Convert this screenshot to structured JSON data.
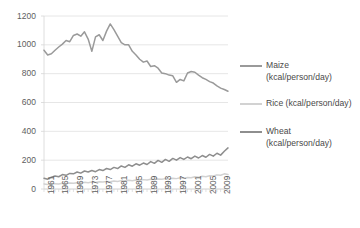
{
  "chart_data": {
    "type": "line",
    "title": "",
    "subtitle": "",
    "xlabel": "",
    "ylabel": "",
    "ylim": [
      0,
      1200
    ],
    "ytick_step": 200,
    "yticks": [
      "0",
      "200",
      "400",
      "600",
      "800",
      "1000",
      "1200"
    ],
    "xlim": [
      1961,
      2011
    ],
    "xticks": [
      "1961",
      "1965",
      "1969",
      "1973",
      "1977",
      "1981",
      "1985",
      "1989",
      "1993",
      "1997",
      "2001",
      "2005",
      "2009"
    ],
    "xtick_step": 4,
    "grid": "horizontal",
    "legend_position": "right",
    "x": [
      1961,
      1962,
      1963,
      1964,
      1965,
      1966,
      1967,
      1968,
      1969,
      1970,
      1971,
      1972,
      1973,
      1974,
      1975,
      1976,
      1977,
      1978,
      1979,
      1980,
      1981,
      1982,
      1983,
      1984,
      1985,
      1986,
      1987,
      1988,
      1989,
      1990,
      1991,
      1992,
      1993,
      1994,
      1995,
      1996,
      1997,
      1998,
      1999,
      2000,
      2001,
      2002,
      2003,
      2004,
      2005,
      2006,
      2007,
      2008,
      2009,
      2010,
      2011
    ],
    "series": [
      {
        "name": "Maize (kcal/person/day)",
        "color": "#9a9a9a",
        "values": [
          963,
          930,
          938,
          962,
          985,
          1005,
          1030,
          1022,
          1065,
          1075,
          1060,
          1090,
          1040,
          955,
          1055,
          1070,
          1030,
          1095,
          1145,
          1105,
          1060,
          1015,
          1000,
          1000,
          955,
          930,
          900,
          880,
          888,
          850,
          855,
          838,
          805,
          800,
          790,
          785,
          740,
          760,
          750,
          805,
          815,
          810,
          790,
          772,
          760,
          745,
          735,
          715,
          700,
          690,
          678
        ]
      },
      {
        "name": "Rice (kcal/person/day)",
        "color": "#d2d2d2",
        "values": [
          35,
          32,
          38,
          36,
          34,
          40,
          38,
          42,
          40,
          44,
          42,
          46,
          44,
          48,
          46,
          50,
          48,
          52,
          50,
          55,
          52,
          58,
          55,
          60,
          58,
          62,
          60,
          65,
          62,
          68,
          65,
          70,
          68,
          72,
          70,
          75,
          72,
          78,
          75,
          80,
          78,
          85,
          82,
          88,
          85,
          92,
          90,
          98,
          95,
          105,
          100
        ]
      },
      {
        "name": "Wheat (kcal/person/day)",
        "color": "#8e8e8e",
        "values": [
          75,
          68,
          82,
          90,
          85,
          100,
          95,
          108,
          105,
          118,
          110,
          125,
          118,
          128,
          120,
          135,
          128,
          142,
          135,
          150,
          142,
          160,
          150,
          168,
          158,
          175,
          165,
          180,
          170,
          190,
          178,
          198,
          185,
          205,
          192,
          212,
          200,
          218,
          205,
          222,
          210,
          228,
          215,
          232,
          220,
          240,
          228,
          248,
          235,
          262,
          285
        ]
      }
    ],
    "legend": [
      {
        "label": "Maize\n(kcal/person/day)",
        "color": "#9a9a9a"
      },
      {
        "label": "Rice (kcal/person/day)",
        "color": "#d2d2d2"
      },
      {
        "label": "Wheat\n(kcal/person/day)",
        "color": "#8e8e8e"
      }
    ]
  },
  "colors": {
    "maize": "#9a9a9a",
    "rice": "#d2d2d2",
    "wheat": "#8e8e8e",
    "gridline": "#e0e0e0",
    "axis": "#d6d6d6",
    "tick_text": "#5e5e5e",
    "background": "#ffffff"
  }
}
